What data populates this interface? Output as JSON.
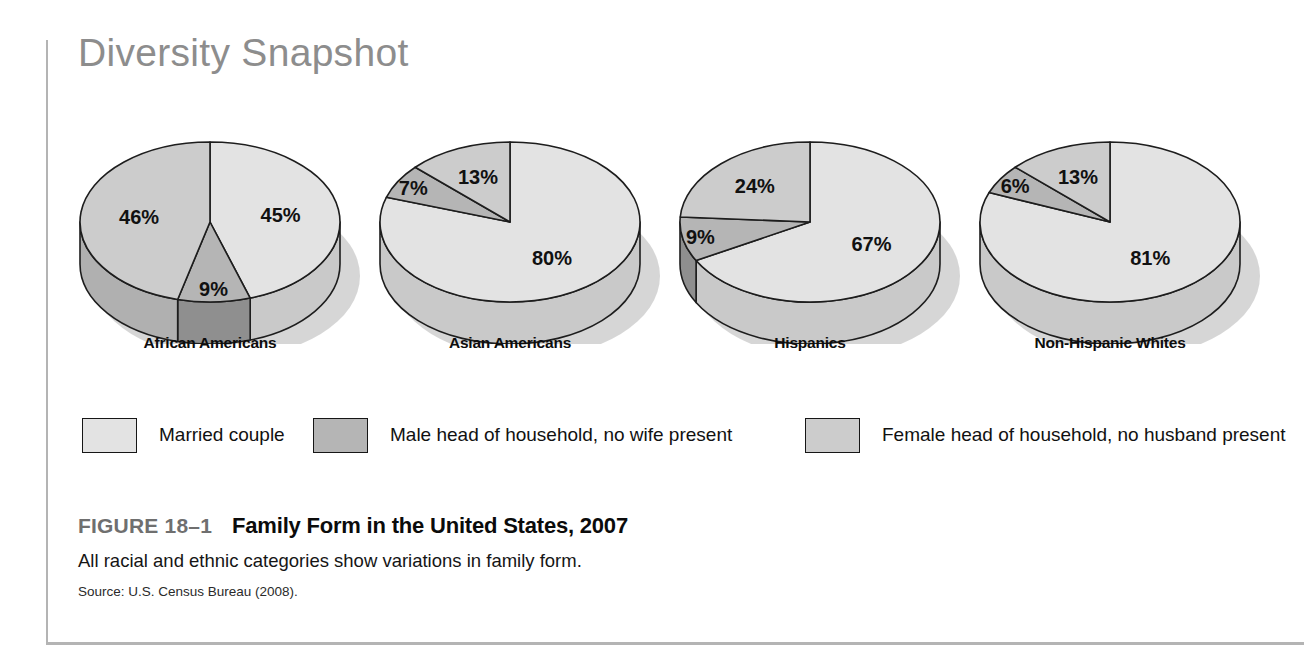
{
  "figure": {
    "snapshot_title": "Diversity Snapshot",
    "figure_number": "FIGURE 18–1",
    "figure_title": "Family Form in the United States, 2007",
    "subtitle": "All racial and ethnic categories show variations in family form.",
    "source": "Source: U.S. Census Bureau (2008)."
  },
  "legend": {
    "items": [
      {
        "label": "Married couple",
        "color": "#e3e3e3"
      },
      {
        "label": "Male head of household, no wife present",
        "color": "#b5b5b5"
      },
      {
        "label": "Female head of household, no husband present",
        "color": "#cccccc"
      }
    ]
  },
  "chart_data": {
    "type": "pie",
    "title": "Family Form in the United States, 2007",
    "subtitle": "All racial and ethnic categories show variations in family form.",
    "source": "U.S. Census Bureau (2008).",
    "unit": "percent",
    "legend_position": "bottom",
    "categories": [
      "Married couple",
      "Male head of household, no wife present",
      "Female head of household, no husband present"
    ],
    "category_colors": [
      "#e3e3e3",
      "#b5b5b5",
      "#cccccc"
    ],
    "charts": [
      {
        "name": "African Americans",
        "slices": [
          {
            "category": "Married couple",
            "value": 45,
            "label": "45%"
          },
          {
            "category": "Male head of household, no wife present",
            "value": 9,
            "label": "9%"
          },
          {
            "category": "Female head of household, no husband present",
            "value": 46,
            "label": "46%"
          }
        ]
      },
      {
        "name": "Asian Americans",
        "slices": [
          {
            "category": "Married couple",
            "value": 80,
            "label": "80%"
          },
          {
            "category": "Male head of household, no wife present",
            "value": 7,
            "label": "7%"
          },
          {
            "category": "Female head of household, no husband present",
            "value": 13,
            "label": "13%"
          }
        ]
      },
      {
        "name": "Hispanics",
        "slices": [
          {
            "category": "Married couple",
            "value": 67,
            "label": "67%"
          },
          {
            "category": "Male head of household, no wife present",
            "value": 9,
            "label": "9%"
          },
          {
            "category": "Female head of household, no husband present",
            "value": 24,
            "label": "24%"
          }
        ]
      },
      {
        "name": "Non-Hispanic Whites",
        "slices": [
          {
            "category": "Married couple",
            "value": 81,
            "label": "81%"
          },
          {
            "category": "Male head of household, no wife present",
            "value": 6,
            "label": "6%"
          },
          {
            "category": "Female head of household, no husband present",
            "value": 13,
            "label": "13%"
          }
        ]
      }
    ]
  }
}
